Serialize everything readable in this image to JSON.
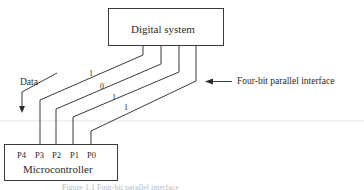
{
  "diagram": {
    "top_box": {
      "label": "Digital system"
    },
    "bottom_box": {
      "label": "Microcontroller",
      "pins": [
        "P4",
        "P3",
        "P2",
        "P1",
        "P0"
      ]
    },
    "wires": [
      {
        "pin": "P3",
        "bit": "1"
      },
      {
        "pin": "P2",
        "bit": "0"
      },
      {
        "pin": "P1",
        "bit": "1"
      },
      {
        "pin": "P0",
        "bit": "1"
      }
    ],
    "data_arrow_label": "Data",
    "interface_label": "Four-bit parallel interface",
    "caption": "Figure 1.1  Four-bit parallel interface"
  },
  "colors": {
    "line": "#3a3a3a",
    "background": "#ffffff"
  }
}
